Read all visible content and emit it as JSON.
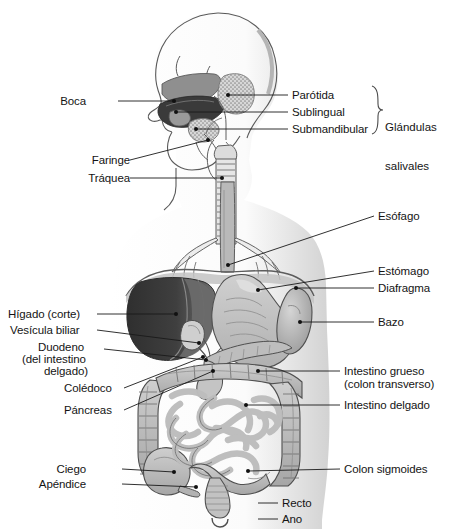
{
  "figure": {
    "language": "es",
    "orientation": "sagittal / frontal composite, head in left profile"
  },
  "palette": {
    "outline": "#555555",
    "body_fill": "#ffffff",
    "body_shade": "#d9d9d9",
    "organ_light": "#c9c9c9",
    "organ_mid": "#a8a8a8",
    "organ_dark": "#6e6e6e",
    "liver_cut": "#3a3a3a",
    "liver_mid": "#5e5e5e",
    "leader_line": "#1a1a1a",
    "text": "#141414"
  },
  "labels": {
    "left": [
      {
        "id": "boca",
        "text": "Boca",
        "x": 86,
        "y": 95,
        "align": "right",
        "anchor_x": 118,
        "anchor_y": 101,
        "point_x": 174,
        "point_y": 101
      },
      {
        "id": "faringe",
        "text": "Faringe",
        "x": 86,
        "y": 154,
        "align": "right",
        "anchor_x": 130,
        "anchor_y": 160,
        "point_x": 208,
        "point_y": 140
      },
      {
        "id": "traquea",
        "text": "Tráquea",
        "x": 86,
        "y": 172,
        "align": "right",
        "anchor_x": 130,
        "anchor_y": 178,
        "point_x": 222,
        "point_y": 178
      },
      {
        "id": "higado",
        "text": "Hígado (corte)",
        "x": 8,
        "y": 308,
        "align": "left",
        "anchor_x": 97,
        "anchor_y": 314,
        "point_x": 176,
        "point_y": 314
      },
      {
        "id": "vesicula",
        "text": "Vesícula biliar",
        "x": 10,
        "y": 324,
        "align": "left",
        "anchor_x": 97,
        "anchor_y": 330,
        "point_x": 199,
        "point_y": 343
      },
      {
        "id": "duodeno",
        "text": "Duodeno",
        "x": 38,
        "y": 340,
        "align": "left",
        "anchor_x": 104,
        "anchor_y": 349,
        "point_x": 206,
        "point_y": 360
      },
      {
        "id": "duodeno2",
        "text": "(del intestino",
        "x": 22,
        "y": 352,
        "align": "left"
      },
      {
        "id": "duodeno3",
        "text": "delgado)",
        "x": 44,
        "y": 364,
        "align": "left"
      },
      {
        "id": "coledoco",
        "text": "Colédoco",
        "x": 64,
        "y": 382,
        "align": "left",
        "anchor_x": 124,
        "anchor_y": 388,
        "point_x": 203,
        "point_y": 357
      },
      {
        "id": "pancreas",
        "text": "Páncreas",
        "x": 64,
        "y": 404,
        "align": "left",
        "anchor_x": 124,
        "anchor_y": 410,
        "point_x": 213,
        "point_y": 371
      },
      {
        "id": "ciego",
        "text": "Ciego",
        "x": 86,
        "y": 463,
        "align": "right",
        "anchor_x": 122,
        "anchor_y": 469,
        "point_x": 174,
        "point_y": 472
      },
      {
        "id": "apendice",
        "text": "Apéndice",
        "x": 70,
        "y": 478,
        "align": "right",
        "anchor_x": 122,
        "anchor_y": 484,
        "point_x": 196,
        "point_y": 487
      }
    ],
    "right": [
      {
        "id": "parotida",
        "text": "Parótida",
        "x": 292,
        "y": 89,
        "align": "left",
        "anchor_x": 288,
        "anchor_y": 95,
        "point_x": 228,
        "point_y": 95
      },
      {
        "id": "sublingual",
        "text": "Sublingual",
        "x": 292,
        "y": 106,
        "align": "left",
        "anchor_x": 288,
        "anchor_y": 112,
        "point_x": 176,
        "point_y": 112
      },
      {
        "id": "submandibular",
        "text": "Submandibular",
        "x": 292,
        "y": 123,
        "align": "left",
        "anchor_x": 288,
        "anchor_y": 129,
        "point_x": 196,
        "point_y": 129
      },
      {
        "id": "esofago",
        "text": "Esófago",
        "x": 378,
        "y": 210,
        "align": "left",
        "anchor_x": 374,
        "anchor_y": 216,
        "point_x": 228,
        "point_y": 265
      },
      {
        "id": "estomago",
        "text": "Estómago",
        "x": 378,
        "y": 265,
        "align": "left",
        "anchor_x": 374,
        "anchor_y": 271,
        "point_x": 258,
        "point_y": 290
      },
      {
        "id": "diafragma",
        "text": "Diafragma",
        "x": 378,
        "y": 282,
        "align": "left",
        "anchor_x": 374,
        "anchor_y": 288,
        "point_x": 296,
        "point_y": 288
      },
      {
        "id": "bazo",
        "text": "Bazo",
        "x": 378,
        "y": 316,
        "align": "left",
        "anchor_x": 374,
        "anchor_y": 322,
        "point_x": 300,
        "point_y": 322
      },
      {
        "id": "intgrueso",
        "text": "Intestino grueso",
        "x": 344,
        "y": 365,
        "align": "left",
        "anchor_x": 340,
        "anchor_y": 371,
        "point_x": 258,
        "point_y": 371
      },
      {
        "id": "intgrueso2",
        "text": "(colon transverso)",
        "x": 344,
        "y": 378,
        "align": "left"
      },
      {
        "id": "intdelgado",
        "text": "Intestino delgado",
        "x": 344,
        "y": 399,
        "align": "left",
        "anchor_x": 340,
        "anchor_y": 405,
        "point_x": 246,
        "point_y": 405
      },
      {
        "id": "sigmoides",
        "text": "Colon sigmoides",
        "x": 344,
        "y": 463,
        "align": "left",
        "anchor_x": 340,
        "anchor_y": 469,
        "point_x": 248,
        "point_y": 471
      },
      {
        "id": "recto",
        "text": "Recto",
        "x": 282,
        "y": 497,
        "align": "left",
        "anchor_x": 278,
        "anchor_y": 503,
        "point_x": 258,
        "point_y": 503
      },
      {
        "id": "ano",
        "text": "Ano",
        "x": 282,
        "y": 513,
        "align": "left",
        "anchor_x": 278,
        "anchor_y": 519,
        "point_x": 258,
        "point_y": 519
      }
    ],
    "groups": [
      {
        "id": "glandulas-salivales",
        "line1": "Glándulas",
        "line2": "salivales",
        "x": 384,
        "y": 99,
        "brace_x": 378,
        "brace_top": 86,
        "brace_bottom": 134
      }
    ]
  },
  "organs": [
    {
      "id": "cavidad-craneal",
      "name": "cráneo"
    },
    {
      "id": "paladar",
      "name": "paladar"
    },
    {
      "id": "lengua",
      "name": "lengua"
    },
    {
      "id": "glandula-parotida",
      "name": "glándula parótida"
    },
    {
      "id": "glandula-sublingual",
      "name": "glándula sublingual"
    },
    {
      "id": "glandula-submandibular",
      "name": "glándula submandibular"
    },
    {
      "id": "faringe-organ",
      "name": "faringe"
    },
    {
      "id": "traquea-organ",
      "name": "tráquea"
    },
    {
      "id": "bronquios",
      "name": "bronquios"
    },
    {
      "id": "esofago-organ",
      "name": "esófago"
    },
    {
      "id": "diafragma-organ",
      "name": "diafragma"
    },
    {
      "id": "higado-organ",
      "name": "hígado (corte)"
    },
    {
      "id": "vesicula-organ",
      "name": "vesícula biliar"
    },
    {
      "id": "estomago-organ",
      "name": "estómago"
    },
    {
      "id": "bazo-organ",
      "name": "bazo"
    },
    {
      "id": "pancreas-organ",
      "name": "páncreas"
    },
    {
      "id": "duodeno-organ",
      "name": "duodeno"
    },
    {
      "id": "coledoco-organ",
      "name": "colédoco"
    },
    {
      "id": "colon-organ",
      "name": "intestino grueso"
    },
    {
      "id": "intestino-delgado-organ",
      "name": "intestino delgado"
    },
    {
      "id": "ciego-organ",
      "name": "ciego"
    },
    {
      "id": "apendice-organ",
      "name": "apéndice"
    },
    {
      "id": "sigmoides-organ",
      "name": "colon sigmoides"
    },
    {
      "id": "recto-organ",
      "name": "recto"
    },
    {
      "id": "ano-organ",
      "name": "ano"
    }
  ]
}
